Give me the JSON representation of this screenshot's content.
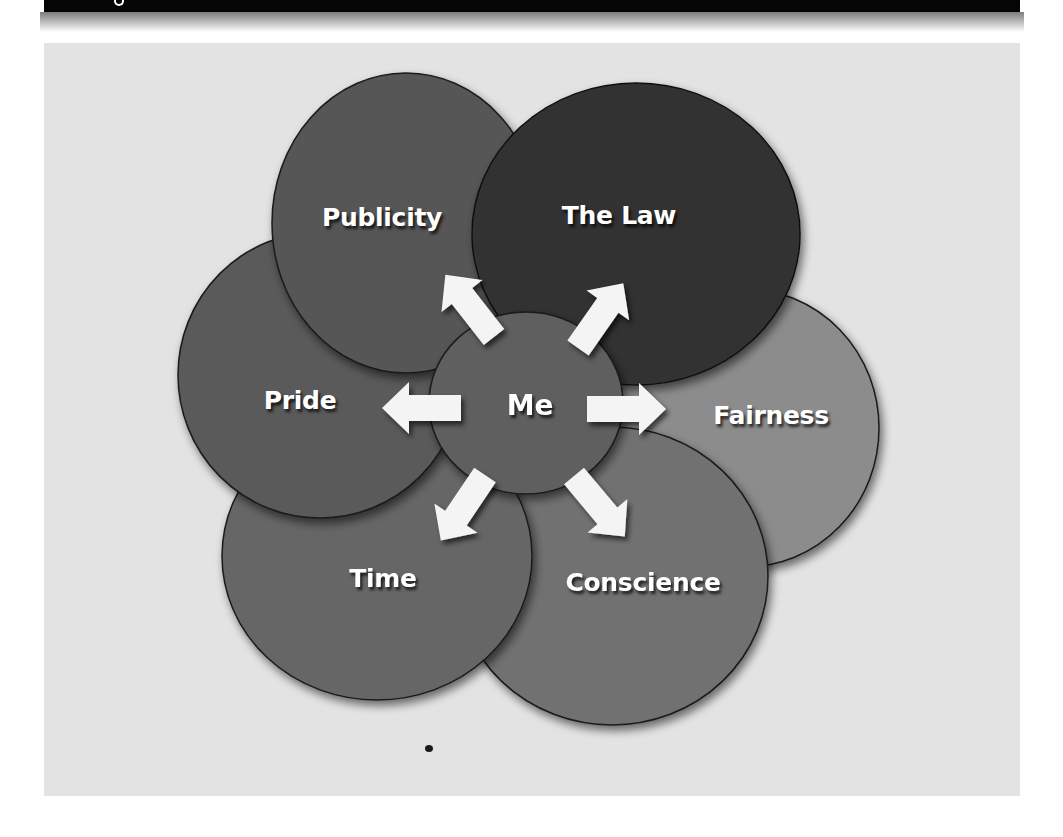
{
  "header": {
    "title_visible_fragment": "g"
  },
  "diagram": {
    "type": "influence-circles",
    "center": {
      "label": "Me",
      "color": "#5f5f5f"
    },
    "factors": [
      {
        "id": "publicity",
        "label": "Publicity",
        "color": "#565656"
      },
      {
        "id": "the-law",
        "label": "The Law",
        "color": "#333333"
      },
      {
        "id": "fairness",
        "label": "Fairness",
        "color": "#8c8c8c"
      },
      {
        "id": "conscience",
        "label": "Conscience",
        "color": "#717171"
      },
      {
        "id": "time",
        "label": "Time",
        "color": "#666666"
      },
      {
        "id": "pride",
        "label": "Pride",
        "color": "#5a5a5a"
      }
    ],
    "arrows": [
      {
        "from": "Me",
        "to": "Publicity",
        "direction": "up-left"
      },
      {
        "from": "Me",
        "to": "The Law",
        "direction": "up-right"
      },
      {
        "from": "Me",
        "to": "Fairness",
        "direction": "right"
      },
      {
        "from": "Me",
        "to": "Conscience",
        "direction": "down-right"
      },
      {
        "from": "Me",
        "to": "Time",
        "direction": "down-left"
      },
      {
        "from": "Me",
        "to": "Pride",
        "direction": "left"
      }
    ],
    "background_color": "#e3e3e3",
    "arrow_color": "#f4f4f4",
    "label_color": "#ffffff"
  }
}
